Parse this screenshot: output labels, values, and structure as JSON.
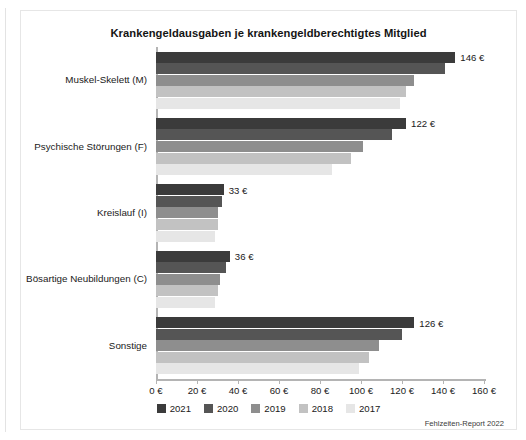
{
  "figure": {
    "title": "Krankengeldausgaben je krankengeldberechtigtes Mitglied",
    "source_note": "Fehlzeiten-Report 2022"
  },
  "chart_data": {
    "type": "bar",
    "orientation": "horizontal",
    "title": "Krankengeldausgaben je krankengeldberechtigtes Mitglied",
    "xlabel": "",
    "ylabel": "",
    "xlim": [
      0,
      160
    ],
    "xtick_labels": [
      "0 €",
      "20 €",
      "40 €",
      "60 €",
      "80 €",
      "100 €",
      "120 €",
      "140 €",
      "160 €"
    ],
    "xticks": [
      0,
      20,
      40,
      60,
      80,
      100,
      120,
      140,
      160
    ],
    "grid": false,
    "legend_position": "bottom",
    "categories": [
      "Muskel-Skelett (M)",
      "Psychische Störungen (F)",
      "Kreislauf (I)",
      "Bösartige Neubildungen (C)",
      "Sonstige"
    ],
    "series": [
      {
        "name": "2021",
        "color": "#3b3b3b",
        "values": [
          146,
          122,
          33,
          36,
          126
        ]
      },
      {
        "name": "2020",
        "color": "#555555",
        "values": [
          141,
          115,
          32,
          34,
          120
        ]
      },
      {
        "name": "2019",
        "color": "#8e8e8e",
        "values": [
          126,
          101,
          30,
          31,
          109
        ]
      },
      {
        "name": "2018",
        "color": "#c2c2c2",
        "values": [
          122,
          95,
          30,
          30,
          104
        ]
      },
      {
        "name": "2017",
        "color": "#e6e6e6",
        "values": [
          119,
          86,
          29,
          29,
          99
        ]
      }
    ],
    "value_labels": [
      {
        "category": "Muskel-Skelett (M)",
        "series": "2021",
        "text": "146 €"
      },
      {
        "category": "Psychische Störungen (F)",
        "series": "2021",
        "text": "122 €"
      },
      {
        "category": "Kreislauf (I)",
        "series": "2021",
        "text": "33 €"
      },
      {
        "category": "Bösartige Neubildungen (C)",
        "series": "2021",
        "text": "36 €"
      },
      {
        "category": "Sonstige",
        "series": "2021",
        "text": "126 €"
      }
    ]
  }
}
